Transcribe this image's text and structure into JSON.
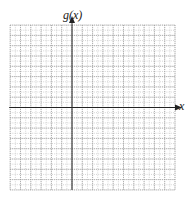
{
  "chart_data": {
    "type": "line",
    "title": "",
    "xlabel": "x",
    "ylabel": "g(x)",
    "series": [],
    "grid": true,
    "grid_style": "dotted",
    "grid_cells": {
      "left_of_y_axis": 6,
      "right_of_y_axis": 10,
      "above_x_axis": 8,
      "below_x_axis": 8
    },
    "tick_labels": [],
    "legend": null
  },
  "labels": {
    "y_axis": "g(x)",
    "x_axis": "x"
  },
  "colors": {
    "grid": "#b8b8b8",
    "axis": "#222222",
    "background": "#ffffff"
  }
}
